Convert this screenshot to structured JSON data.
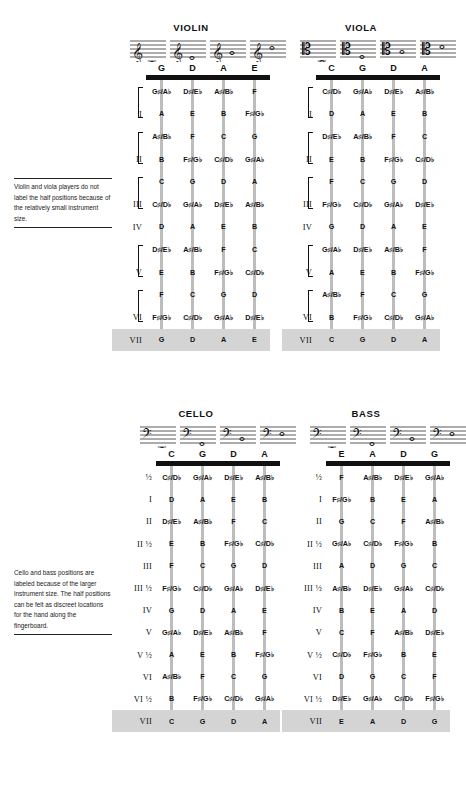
{
  "notes": {
    "violin_viola": "Violin and viola players do not label the half positions because of the relatively small instrument size.",
    "cello_bass": "Cello and bass positions are labeled because of the larger instrument size. The half positions can be felt as discreet locations for the hand along the fingerboard."
  },
  "footer": "",
  "colors": {
    "nut": "#111111",
    "string": "#bdbdbd",
    "highlight_row": "#d4d4d4",
    "text": "#111111"
  },
  "instruments": [
    {
      "id": "violin",
      "title": "VIOLIN",
      "clef": "treble",
      "open_strings": [
        "G",
        "D",
        "A",
        "E"
      ],
      "labeled_halves": false,
      "rows": [
        {
          "position": "",
          "bracket": "open",
          "notes": [
            "G♯/A♭",
            "D♯/E♭",
            "A♯/B♭",
            "F"
          ]
        },
        {
          "position": "I",
          "bracket": "close",
          "notes": [
            "A",
            "E",
            "B",
            "F♯/G♭"
          ]
        },
        {
          "position": "",
          "bracket": "open",
          "notes": [
            "A♯/B♭",
            "F",
            "C",
            "G"
          ]
        },
        {
          "position": "II",
          "bracket": "close",
          "notes": [
            "B",
            "F♯/G♭",
            "C♯/D♭",
            "G♯/A♭"
          ]
        },
        {
          "position": "",
          "bracket": "open",
          "notes": [
            "C",
            "G",
            "D",
            "A"
          ]
        },
        {
          "position": "III",
          "bracket": "close",
          "notes": [
            "C♯/D♭",
            "G♯/A♭",
            "D♯/E♭",
            "A♯/B♭"
          ]
        },
        {
          "position": "IV",
          "bracket": "none",
          "notes": [
            "D",
            "A",
            "E",
            "B"
          ]
        },
        {
          "position": "",
          "bracket": "open",
          "notes": [
            "D♯/E♭",
            "A♯/B♭",
            "F",
            "C"
          ]
        },
        {
          "position": "V",
          "bracket": "close",
          "notes": [
            "E",
            "B",
            "F♯/G♭",
            "C♯/D♭"
          ]
        },
        {
          "position": "",
          "bracket": "open",
          "notes": [
            "F",
            "C",
            "G",
            "D"
          ]
        },
        {
          "position": "VI",
          "bracket": "close",
          "notes": [
            "F♯/G♭",
            "C♯/D♭",
            "G♯/A♭",
            "D♯/E♭"
          ]
        },
        {
          "position": "VII",
          "bracket": "none",
          "highlight": true,
          "notes": [
            "G",
            "D",
            "A",
            "E"
          ]
        }
      ]
    },
    {
      "id": "viola",
      "title": "VIOLA",
      "clef": "alto",
      "open_strings": [
        "C",
        "G",
        "D",
        "A"
      ],
      "labeled_halves": false,
      "rows": [
        {
          "position": "",
          "bracket": "open",
          "notes": [
            "C♯/D♭",
            "G♯/A♭",
            "D♯/E♭",
            "A♯/B♭"
          ]
        },
        {
          "position": "I",
          "bracket": "close",
          "notes": [
            "D",
            "A",
            "E",
            "B"
          ]
        },
        {
          "position": "",
          "bracket": "open",
          "notes": [
            "D♯/E♭",
            "A♯/B♭",
            "F",
            "C"
          ]
        },
        {
          "position": "II",
          "bracket": "close",
          "notes": [
            "E",
            "B",
            "F♯/G♭",
            "C♯/D♭"
          ]
        },
        {
          "position": "",
          "bracket": "open",
          "notes": [
            "F",
            "C",
            "G",
            "D"
          ]
        },
        {
          "position": "III",
          "bracket": "close",
          "notes": [
            "F♯/G♭",
            "C♯/D♭",
            "G♯/A♭",
            "D♯/E♭"
          ]
        },
        {
          "position": "IV",
          "bracket": "none",
          "notes": [
            "G",
            "D",
            "A",
            "E"
          ]
        },
        {
          "position": "",
          "bracket": "open",
          "notes": [
            "G♯/A♭",
            "D♯/E♭",
            "A♯/B♭",
            "F"
          ]
        },
        {
          "position": "V",
          "bracket": "close",
          "notes": [
            "A",
            "E",
            "B",
            "F♯/G♭"
          ]
        },
        {
          "position": "",
          "bracket": "open",
          "notes": [
            "A♯/B♭",
            "F",
            "C",
            "G"
          ]
        },
        {
          "position": "VI",
          "bracket": "close",
          "notes": [
            "B",
            "F♯/G♭",
            "C♯/D♭",
            "G♯/A♭"
          ]
        },
        {
          "position": "VII",
          "bracket": "none",
          "highlight": true,
          "notes": [
            "C",
            "G",
            "D",
            "A"
          ]
        }
      ]
    },
    {
      "id": "cello",
      "title": "CELLO",
      "clef": "bass",
      "open_strings": [
        "C",
        "G",
        "D",
        "A"
      ],
      "labeled_halves": true,
      "rows": [
        {
          "position": "½",
          "notes": [
            "C♯/D♭",
            "G♯/A♭",
            "D♯/E♭",
            "A♯/B♭"
          ]
        },
        {
          "position": "I",
          "notes": [
            "D",
            "A",
            "E",
            "B"
          ]
        },
        {
          "position": "II",
          "notes": [
            "D♯/E♭",
            "A♯/B♭",
            "F",
            "C"
          ]
        },
        {
          "position": "II ½",
          "notes": [
            "E",
            "B",
            "F♯/G♭",
            "C♯/D♭"
          ]
        },
        {
          "position": "III",
          "notes": [
            "F",
            "C",
            "G",
            "D"
          ]
        },
        {
          "position": "III ½",
          "notes": [
            "F♯/G♭",
            "C♯/D♭",
            "G♯/A♭",
            "D♯/E♭"
          ]
        },
        {
          "position": "IV",
          "notes": [
            "G",
            "D",
            "A",
            "E"
          ]
        },
        {
          "position": "V",
          "notes": [
            "G♯/A♭",
            "D♯/E♭",
            "A♯/B♭",
            "F"
          ]
        },
        {
          "position": "V ½",
          "notes": [
            "A",
            "E",
            "B",
            "F♯/G♭"
          ]
        },
        {
          "position": "VI",
          "notes": [
            "A♯/B♭",
            "F",
            "C",
            "G"
          ]
        },
        {
          "position": "VI ½",
          "notes": [
            "B",
            "F♯/G♭",
            "C♯/D♭",
            "G♯/A♭"
          ]
        },
        {
          "position": "VII",
          "highlight": true,
          "notes": [
            "C",
            "G",
            "D",
            "A"
          ]
        }
      ]
    },
    {
      "id": "bass",
      "title": "BASS",
      "clef": "bass",
      "open_strings": [
        "E",
        "A",
        "D",
        "G"
      ],
      "labeled_halves": true,
      "rows": [
        {
          "position": "½",
          "notes": [
            "F",
            "A♯/B♭",
            "D♯/E♭",
            "G♯/A♭"
          ]
        },
        {
          "position": "I",
          "notes": [
            "F♯/G♭",
            "B",
            "E",
            "A"
          ]
        },
        {
          "position": "II",
          "notes": [
            "G",
            "C",
            "F",
            "A♯/B♭"
          ]
        },
        {
          "position": "II ½",
          "notes": [
            "G♯/A♭",
            "C♯/D♭",
            "F♯/G♭",
            "B"
          ]
        },
        {
          "position": "III",
          "notes": [
            "A",
            "D",
            "G",
            "C"
          ]
        },
        {
          "position": "III ½",
          "notes": [
            "A♯/B♭",
            "D♯/E♭",
            "G♯/A♭",
            "C♯/D♭"
          ]
        },
        {
          "position": "IV",
          "notes": [
            "B",
            "E",
            "A",
            "D"
          ]
        },
        {
          "position": "V",
          "notes": [
            "C",
            "F",
            "A♯/B♭",
            "D♯/E♭"
          ]
        },
        {
          "position": "V ½",
          "notes": [
            "C♯/D♭",
            "F♯/G♭",
            "B",
            "E"
          ]
        },
        {
          "position": "VI",
          "notes": [
            "D",
            "G",
            "C",
            "F"
          ]
        },
        {
          "position": "VI ½",
          "notes": [
            "D♯/E♭",
            "G♯/A♭",
            "C♯/D♭",
            "F♯/G♭"
          ]
        },
        {
          "position": "VII",
          "highlight": true,
          "notes": [
            "E",
            "A",
            "D",
            "G"
          ]
        }
      ]
    }
  ]
}
